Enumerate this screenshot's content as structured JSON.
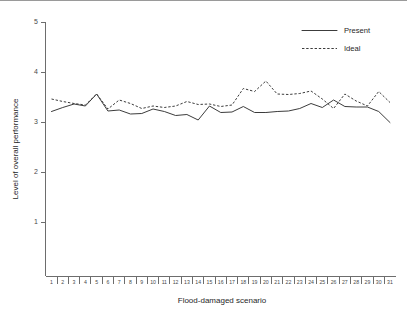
{
  "chart_data": {
    "type": "line",
    "title": "",
    "xlabel": "Flood-damaged scenario",
    "ylabel": "Level of overall performance",
    "xlim": [
      0.4,
      31.6
    ],
    "ylim": [
      0.2,
      5.0
    ],
    "yticks": [
      1,
      2,
      3,
      4,
      5
    ],
    "ytick_labels": [
      "1",
      "2",
      "3",
      "4",
      "5"
    ],
    "x": [
      1,
      2,
      3,
      4,
      5,
      6,
      7,
      8,
      9,
      10,
      11,
      12,
      13,
      14,
      15,
      16,
      17,
      18,
      19,
      20,
      21,
      22,
      23,
      24,
      25,
      26,
      27,
      28,
      29,
      30,
      31
    ],
    "xtick_labels": [
      "1",
      "2",
      "3",
      "4",
      "5",
      "6",
      "7",
      "8",
      "9",
      "10",
      "11",
      "12",
      "13",
      "14",
      "15",
      "16",
      "17",
      "18",
      "19",
      "20",
      "21",
      "22",
      "23",
      "24",
      "25",
      "26",
      "27",
      "28",
      "29",
      "30",
      "31"
    ],
    "grid": false,
    "legend_position": "top-right",
    "series": [
      {
        "name": "Present",
        "style": "solid",
        "color": "#3c3c3c",
        "values": [
          3.22,
          3.3,
          3.37,
          3.33,
          3.57,
          3.23,
          3.25,
          3.17,
          3.18,
          3.27,
          3.22,
          3.14,
          3.16,
          3.05,
          3.33,
          3.2,
          3.21,
          3.32,
          3.2,
          3.2,
          3.22,
          3.23,
          3.28,
          3.38,
          3.3,
          3.45,
          3.32,
          3.31,
          3.31,
          3.22,
          3.0
        ]
      },
      {
        "name": "Ideal",
        "style": "dashed",
        "color": "#3c3c3c",
        "values": [
          3.47,
          3.42,
          3.38,
          3.35,
          3.57,
          3.27,
          3.45,
          3.38,
          3.28,
          3.33,
          3.3,
          3.33,
          3.42,
          3.36,
          3.37,
          3.32,
          3.35,
          3.68,
          3.62,
          3.83,
          3.57,
          3.56,
          3.58,
          3.63,
          3.47,
          3.28,
          3.57,
          3.43,
          3.33,
          3.62,
          3.4
        ]
      }
    ]
  },
  "legend": {
    "items": [
      {
        "label": "Present",
        "style": "solid"
      },
      {
        "label": "Ideal",
        "style": "dashed"
      }
    ]
  }
}
